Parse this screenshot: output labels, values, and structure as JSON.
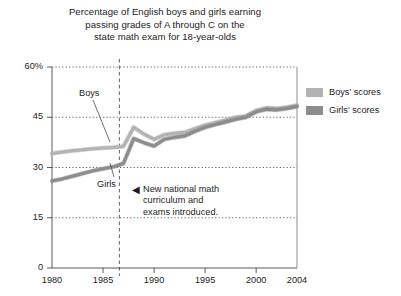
{
  "chart_data": {
    "type": "line",
    "title": "Percentage of English boys and girls earning passing grades of A through C on the state math exam for 18-year-olds",
    "title_lines": [
      "Percentage of English boys and girls earning",
      "passing grades of A through C on the",
      "state math exam for 18-year-olds"
    ],
    "xlabel": "",
    "ylabel": "",
    "xlim": [
      1980,
      2004
    ],
    "ylim": [
      0,
      60
    ],
    "grid": true,
    "grid_style": "dotted-horizontal",
    "legend_position": "right",
    "x_ticks": [
      1980,
      1985,
      1990,
      1995,
      2000,
      2004
    ],
    "x_tick_labels": [
      "1980",
      "1985",
      "1990",
      "1995",
      "2000",
      "2004"
    ],
    "y_ticks": [
      0,
      15,
      30,
      45,
      60
    ],
    "y_tick_labels": [
      "0",
      "15",
      "30",
      "45",
      "60%"
    ],
    "x": [
      1980,
      1981,
      1982,
      1983,
      1984,
      1985,
      1986,
      1987,
      1988,
      1989,
      1990,
      1991,
      1992,
      1993,
      1994,
      1995,
      1996,
      1997,
      1998,
      1999,
      2000,
      2001,
      2002,
      2003,
      2004
    ],
    "series": [
      {
        "name": "Boys' scores",
        "color": "#b3b3b3",
        "values": [
          34.2,
          34.6,
          35.0,
          35.3,
          35.6,
          35.8,
          36.0,
          36.3,
          42.0,
          40.0,
          38.4,
          39.8,
          40.2,
          40.5,
          41.6,
          42.6,
          43.4,
          44.2,
          45.0,
          45.4,
          47.0,
          47.8,
          47.6,
          48.0,
          48.6
        ]
      },
      {
        "name": "Girls' scores",
        "color": "#8c8c8c",
        "values": [
          26.0,
          26.6,
          27.4,
          28.2,
          29.0,
          29.6,
          30.2,
          31.2,
          38.6,
          37.4,
          36.4,
          38.4,
          39.0,
          39.4,
          40.8,
          42.0,
          42.8,
          43.6,
          44.4,
          45.0,
          46.6,
          47.4,
          47.2,
          47.6,
          48.2
        ]
      }
    ],
    "annotations": [
      {
        "name": "new-curriculum-note",
        "marker": "◀",
        "lines": [
          "New national math",
          "curriculum and",
          "exams introduced."
        ],
        "vline_x": 1986.6,
        "vline_style": "dashed"
      }
    ],
    "inline_labels": [
      {
        "name": "boys-label",
        "text": "Boys",
        "series": "Boys' scores"
      },
      {
        "name": "girls-label",
        "text": "Girls",
        "series": "Girls' scores"
      }
    ]
  },
  "legend": {
    "items": [
      {
        "label": "Boys' scores",
        "color": "#b3b3b3"
      },
      {
        "label": "Girls' scores",
        "color": "#8c8c8c"
      }
    ]
  }
}
